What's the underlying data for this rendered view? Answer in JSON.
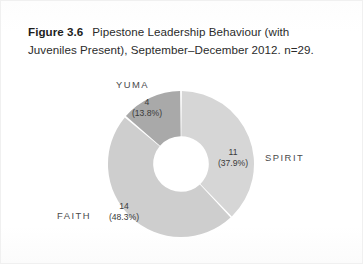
{
  "figure": {
    "number_label": "Figure 3.6",
    "caption_text": "Pipestone Leadership Behaviour (with Juveniles Present), September–December 2012. n=29."
  },
  "chart_data": {
    "type": "pie",
    "variant": "donut",
    "title": "Pipestone Leadership Behaviour (with Juveniles Present), September–December 2012.",
    "sample_size_label": "n=29",
    "sample_size": 29,
    "total": 29,
    "categories": [
      "SPIRIT",
      "FAITH",
      "YUMA"
    ],
    "values": [
      11,
      14,
      4
    ],
    "percentages": [
      37.9,
      48.3,
      13.8
    ],
    "colors": [
      "#d6d6d6",
      "#cecece",
      "#a9a9a9"
    ],
    "legend": "none",
    "grid": false,
    "slices": [
      {
        "name": "SPIRIT",
        "value": 11,
        "percent": 37.9,
        "count_label": "11",
        "percent_label": "(37.9%)",
        "color": "#d6d6d6"
      },
      {
        "name": "FAITH",
        "value": 14,
        "percent": 48.3,
        "count_label": "14",
        "percent_label": "(48.3%)",
        "color": "#cecece"
      },
      {
        "name": "YUMA",
        "value": 4,
        "percent": 13.8,
        "count_label": "4",
        "percent_label": "(13.8%)",
        "color": "#a9a9a9"
      }
    ]
  }
}
